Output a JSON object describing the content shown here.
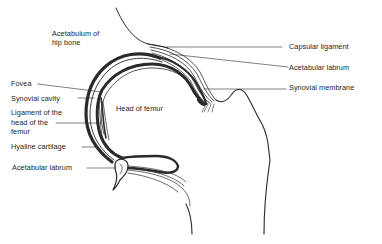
{
  "diagram": {
    "colors": {
      "ink": "#2a2a2a",
      "background": "#ffffff"
    },
    "labels": {
      "acetabulum_line1": "Acetabulum of",
      "acetabulum_line2": "hip bone",
      "fovea": "Fovea",
      "synovial_cavity": "Synovial cavity",
      "ligament_line1": "Ligament of the",
      "ligament_line2": "head of the",
      "ligament_line3": "femur",
      "hyaline_cartilage": "Hyaline cartilage",
      "acetabular_labrum_left": "Acetabular labrum",
      "head_of_femur": "Head of femur",
      "capsular_ligament": "Capsular ligament",
      "acetabular_labrum_right": "Acetabular labrum",
      "synovial_membrane": "Synovial membrane"
    }
  }
}
